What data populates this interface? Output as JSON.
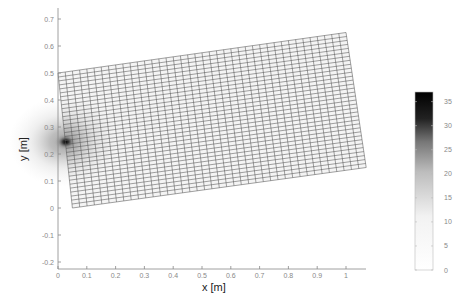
{
  "chart_data": {
    "type": "heatmap",
    "title": "",
    "xlabel": "x [m]",
    "ylabel": "y [m]",
    "xlim": [
      0,
      1.07
    ],
    "ylim": [
      -0.22,
      0.75
    ],
    "x_ticks": [
      "0",
      "0.1",
      "0.2",
      "0.3",
      "0.4",
      "0.5",
      "0.6",
      "0.7",
      "0.8",
      "0.9",
      "1"
    ],
    "y_ticks": [
      "-0.2",
      "-0.1",
      "0",
      "0.1",
      "0.2",
      "0.3",
      "0.4",
      "0.5",
      "0.6",
      "0.7"
    ],
    "grid": false,
    "mesh": {
      "description": "Deformed quadrilateral mesh (tilted rectangle) with scalar field shading",
      "corners": {
        "top_left": [
          0.0,
          0.5
        ],
        "top_right": [
          1.0,
          0.65
        ],
        "bottom_right": [
          1.07,
          0.15
        ],
        "bottom_left": [
          0.05,
          0.0
        ]
      },
      "columns": 40,
      "rows": 34,
      "hotspot": {
        "x": 0.02,
        "y": 0.245,
        "value": 36
      },
      "background_value": 3
    },
    "colorbar": {
      "label": "",
      "min": 0,
      "max": 37,
      "ticks": [
        "0",
        "5",
        "10",
        "15",
        "20",
        "25",
        "30",
        "35"
      ],
      "colormap": "gray_reversed",
      "position": "right"
    }
  }
}
